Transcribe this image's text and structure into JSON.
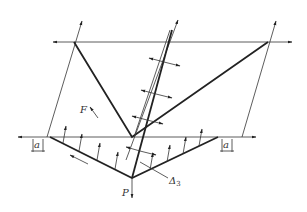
{
  "diagram": {
    "labels": {
      "force_F": "F",
      "load_P": "P",
      "delta": "Δ",
      "delta_sub": "3",
      "dim_left": "a",
      "dim_right": "a"
    },
    "colors": {
      "line": "#333333",
      "heavy_line": "#222222",
      "background": "#ffffff"
    }
  }
}
